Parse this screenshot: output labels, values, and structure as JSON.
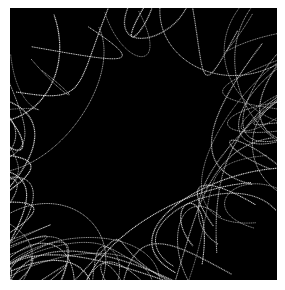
{
  "image": {
    "description": "Dense tangle of thin white looping curves on black background with a large empty dark oval region in the center-left",
    "colors": {
      "background": "#000000",
      "border": "#ffffff",
      "curves": "#d8d8d8"
    }
  }
}
